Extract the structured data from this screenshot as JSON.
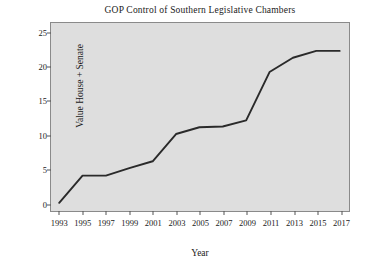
{
  "chart_data": {
    "type": "line",
    "title": "GOP Control of Southern Legislative Chambers",
    "xlabel": "Year",
    "ylabel": "Value House + Senate",
    "x": [
      1993,
      1995,
      1997,
      1999,
      2001,
      2003,
      2005,
      2007,
      2009,
      2011,
      2013,
      2015,
      2017
    ],
    "values": [
      0,
      4.0,
      4.0,
      5.1,
      6.1,
      10.1,
      11.1,
      11.2,
      12.1,
      19.2,
      21.3,
      22.3,
      22.3
    ],
    "xtick_labels": [
      "1993",
      "1995",
      "1997",
      "1999",
      "2001",
      "2003",
      "2005",
      "2007",
      "2009",
      "2011",
      "2013",
      "2015",
      "2017"
    ],
    "ytick_labels": [
      "0",
      "5",
      "10",
      "15",
      "20",
      "25"
    ],
    "yticks": [
      0,
      5,
      10,
      15,
      20,
      25
    ],
    "xlim": [
      1992.3,
      2017.8
    ],
    "ylim": [
      -1.2,
      26.4
    ],
    "grid": false,
    "legend": null,
    "line_color": "#2a2a2a",
    "plot_background": "#dedede",
    "figure_background": "#ffffff"
  }
}
